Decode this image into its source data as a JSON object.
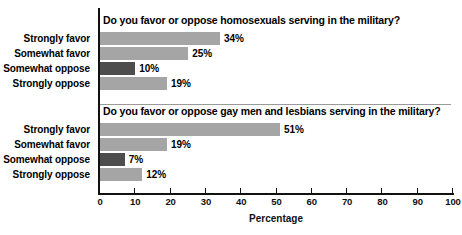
{
  "chart_data": {
    "type": "bar",
    "title": "",
    "xlabel": "Percentage",
    "ylabel": "",
    "xlim": [
      0,
      100
    ],
    "grid": false,
    "legend": false,
    "orientation": "horizontal",
    "tick_labels": [
      "0",
      "10",
      "20",
      "30",
      "40",
      "50",
      "60",
      "70",
      "80",
      "90",
      "100"
    ],
    "tick_values": [
      0,
      10,
      20,
      30,
      40,
      50,
      60,
      70,
      80,
      90,
      100
    ],
    "categories": [
      "Strongly favor",
      "Somewhat favor",
      "Somewhat oppose",
      "Strongly oppose"
    ],
    "panels": [
      {
        "title_plain_1": "Do you favor or oppose ",
        "title_bold": "homosexuals",
        "title_plain_2": " serving in the military?",
        "values": [
          34,
          25,
          10,
          19
        ],
        "value_labels": [
          "34%",
          "25%",
          "10%",
          "19%"
        ]
      },
      {
        "title_plain_1": "Do you favor or oppose ",
        "title_bold": "gay men and lesbians",
        "title_plain_2": " serving in the military?",
        "values": [
          51,
          19,
          7,
          12
        ],
        "value_labels": [
          "51%",
          "19%",
          "7%",
          "12%"
        ]
      }
    ],
    "colors": {
      "bar_light": "#a5a5a5",
      "bar_dark": "#4d4d4d",
      "axis": "#111111",
      "divider": "#9a9a9a",
      "background": "#ffffff"
    }
  }
}
